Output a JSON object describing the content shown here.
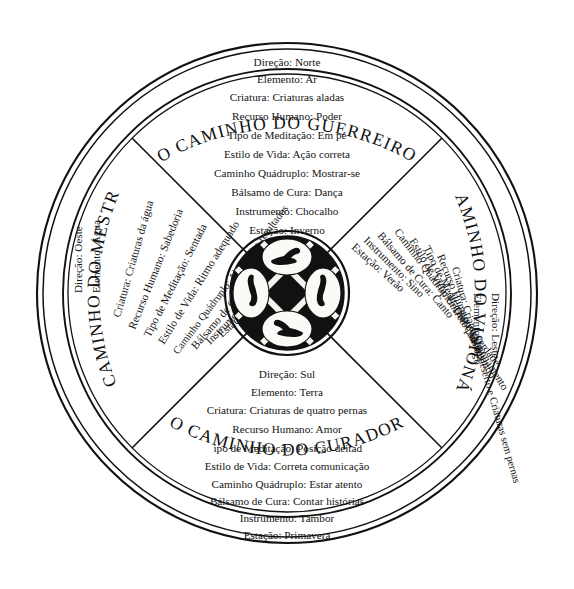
{
  "figure": {
    "background_color": "#ffffff",
    "ink_color": "#111111"
  },
  "arc_titles": {
    "north": "O CAMINHO DO GUERREIRO",
    "south": "O CAMINHO DO CURADOR",
    "west": "O CAMINHO DO MESTRE",
    "east": "O CAMINHO DO VISIONÁRIO"
  },
  "quadrants": {
    "north": {
      "name": "O CAMINHO DO GUERREIRO",
      "lines": [
        "Direção: Norte",
        "Elemento: Ar",
        "Criatura: Criaturas aladas",
        "Recurso Humano: Poder",
        "Tipo de Meditação: Em pé",
        "Estilo de Vida: Ação correta",
        "Caminho Quádruplo: Mostrar-se",
        "Bálsamo de Cura: Dança",
        "Instrumento: Chocalho",
        "Estação: Inverno"
      ]
    },
    "south": {
      "name": "O CAMINHO DO CURADOR",
      "lines": [
        "Direção: Sul",
        "Elemento: Terra",
        "Criatura: Criaturas de quatro pernas",
        "Recurso Humano: Amor",
        "Tipo de Meditação: Posição deitada",
        "Estilo de Vida: Correta comunicação",
        "Caminho Quádruplo: Estar atento",
        "Bálsamo de Cura: Contar histórias",
        "Instrumento: Tambor",
        "Estação: Primavera"
      ]
    },
    "west": {
      "name": "O CAMINHO DO MESTRE",
      "lines": [
        "Direção: Oeste",
        "Elemento: Água",
        "Criatura: Criaturas da água",
        "Recurso Humano: Sabedoria",
        "Tipo de Meditação: Sentada",
        "Estilo de Vida: Ritmo adequado",
        "Caminho Quádruplo: Aberto aos resultados",
        "Bálsamo de Cura: Silêncio",
        "Instrumento: Varetas, ossos",
        "Estação: Outono"
      ]
    },
    "east": {
      "name": "O CAMINHO DO VISIONÁRIO",
      "lines": [
        "Direção: Leste",
        "Elemento: Fogo",
        "Criatura: Criaturas do deserto e Criaturas sem pernas",
        "Recurso Humano: Visões",
        "Tipo de Meditação: Caminhando",
        "Estilo de Vida: Correto posicionamento",
        "Caminho Quádruplo: Dizer a verdade",
        "Bálsamo de Cura: Canto",
        "Instrumento: Sino",
        "Estação: Verão"
      ]
    }
  },
  "hub": {
    "description": "Disco central preto com cruz diagonal e quatro medalhões brancos",
    "medallions": [
      {
        "position": "top",
        "creature": "creature-north-glyph"
      },
      {
        "position": "right",
        "creature": "creature-east-glyph"
      },
      {
        "position": "bottom",
        "creature": "creature-south-glyph"
      },
      {
        "position": "left",
        "creature": "creature-west-glyph"
      }
    ]
  }
}
